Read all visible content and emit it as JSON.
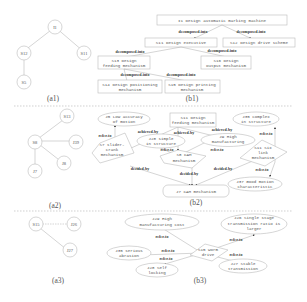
{
  "captions": {
    "a1": "(a1)",
    "b1": "(b1)",
    "a2": "(a2)",
    "b2": "(b2)",
    "a3": "(a3)",
    "b3": "(b3)"
  },
  "a1": {
    "nodes": [
      "I1",
      "S12",
      "S11",
      "S5"
    ]
  },
  "b1": {
    "nodes": [
      "I1 Design automatic marking machine",
      "S11 Design executive",
      "S12 Design drive scheme",
      "S13 Design",
      "feeding mechanism",
      "S16 Design",
      "output mechanism",
      "S14 Design positioning",
      "mechanism",
      "S15 Design printing",
      "mechanism"
    ],
    "edge_label": "decomposed-into"
  },
  "a2": {
    "nodes": [
      "S13",
      "S8",
      "J39",
      "J8",
      "J7"
    ]
  },
  "b2": {
    "nodes": {
      "j25_1": "J5 Low accuracy",
      "j25_2": "of motion",
      "s11_1": "S11 Design",
      "s11_2": "feeding mechanism",
      "j35_1": "J35 complex",
      "j35_2": "in structure",
      "s7_1": "S7 slider-",
      "s7_2": "crank",
      "s7_3": "mechanism",
      "j28_1": "J28 simple",
      "j28_2": "in structure",
      "j39_1": "J9 High",
      "j39_2": "manufacturing",
      "s8_1": "S8 CAM",
      "s8_2": "mechanism",
      "s11b_1": "S11 Six",
      "s11b_2": "link",
      "s11b_3": "mechanism",
      "j37_1": "J37 Good motion",
      "j37_2": "characteristic",
      "j7": "J7 CAM mechanism"
    },
    "labels": {
      "achieved_by": "achieved-by",
      "refer_to": "refer-to",
      "decided_by": "decided-by"
    }
  },
  "a3": {
    "nodes": [
      "S15",
      "J26",
      "J27"
    ]
  },
  "b3": {
    "nodes": {
      "j29_1": "J29 High",
      "j29_2": "manufacturing cost",
      "j35_1": "J35 serious",
      "j35_2": "abrasion",
      "j28_1": "J28 Self",
      "j28_2": "locking",
      "s15_1": "S15 Worm",
      "s15_2": "drive",
      "j26_1": "J26 Single stage",
      "j26_2": "transmission ratio is",
      "j26_3": "larger",
      "j27_1": "J27 Stable",
      "j27_2": "transmission"
    },
    "labels": {
      "refer_to": "refer-to"
    }
  }
}
